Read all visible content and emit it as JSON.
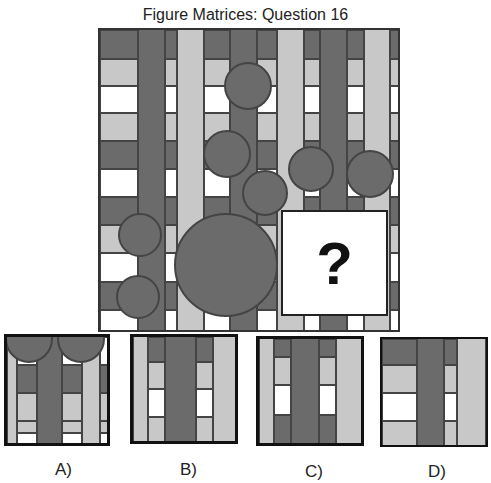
{
  "title": "Figure Matrices: Question 16",
  "question_mark": "?",
  "colors": {
    "dark": "#6b6b6b",
    "light": "#c8c8c8",
    "white": "#ffffff",
    "border": "#444444"
  },
  "options": [
    {
      "label": "A)"
    },
    {
      "label": "B)"
    },
    {
      "label": "C)"
    },
    {
      "label": "D)"
    }
  ]
}
